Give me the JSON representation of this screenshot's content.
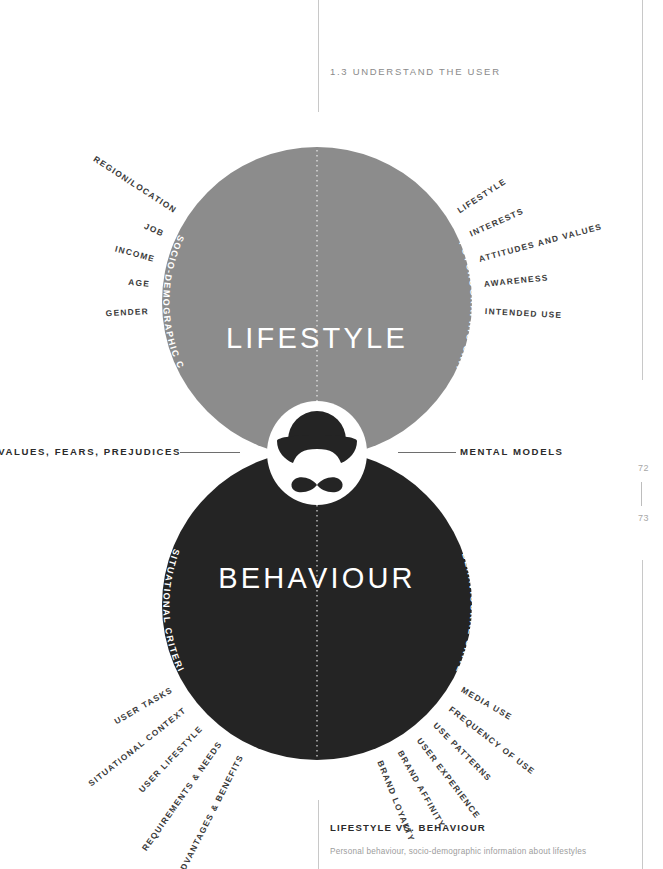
{
  "header": {
    "section_number": "1.3",
    "title": "UNDERSTAND THE USER",
    "full": "1.3  UNDERSTAND THE USER"
  },
  "page_numbers": {
    "left": "72",
    "right": "73"
  },
  "diagram": {
    "top_circle": {
      "title": "LIFESTYLE",
      "color": "#8c8c8c",
      "text_color": "#ffffff"
    },
    "bottom_circle": {
      "title": "BEHAVIOUR",
      "color": "#242424",
      "text_color": "#ffffff"
    },
    "intersection": {
      "color": "#d2d2d2",
      "icon": "bowler-hat-moustache-icon"
    },
    "center_labels": {
      "left": "VALUES, FEARS, PREJUDICES",
      "right": "MENTAL MODELS"
    },
    "arc_labels": {
      "top_left": "SOCIO-DEMOGRAPHIC CRITERIA",
      "top_right": "PSYCHOGRAPHIC CRITERIA",
      "bottom_left": "SITUATIONAL CRITERIA",
      "bottom_right": "BEHAVIOURAL CRITERIA"
    },
    "quadrants": {
      "top_left": [
        "REGION/LOCATION",
        "JOB",
        "INCOME",
        "AGE",
        "GENDER"
      ],
      "top_right": [
        "LIFESTYLE",
        "INTERESTS",
        "ATTITUDES AND VALUES",
        "AWARENESS",
        "INTENDED USE"
      ],
      "bottom_left": [
        "USER TASKS",
        "SITUATIONAL CONTEXT",
        "USER LIFESTYLE",
        "REQUIREMENTS & NEEDS",
        "ADVANTAGES & BENEFITS"
      ],
      "bottom_right": [
        "MEDIA USE",
        "FREQUENCY OF USE",
        "USE PATTERNS",
        "USER EXPERIENCE",
        "BRAND AFFINITY",
        "BRAND LOYALTY"
      ]
    }
  },
  "caption": {
    "heading": "LIFESTYLE VS. BEHAVIOUR",
    "body": "Personal behaviour, socio-demographic information about lifestyles"
  }
}
